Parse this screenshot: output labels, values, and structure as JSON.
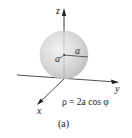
{
  "figure": {
    "caption": "(a)",
    "equation": "ρ = 2a cos φ",
    "axes": {
      "z_label": "z",
      "y_label": "y",
      "x_label": "x"
    },
    "sphere": {
      "radius_label": "a",
      "center_height_label": "a",
      "fill_color": "#d9d9d9"
    },
    "colors": {
      "axis": "#222222",
      "sphere_edge": "#bdbdbd"
    }
  }
}
